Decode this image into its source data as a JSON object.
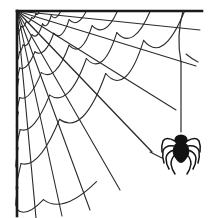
{
  "artwork": {
    "title": "Spider Web Corner With Hanging Spider",
    "type": "line-drawing",
    "width": 212,
    "height": 218,
    "background_color": "#ffffff",
    "line_color": "#2b2b2b",
    "spider_color": "#121212",
    "border_line_color": "#1a1a1a",
    "border_line_width": 2.6,
    "web_line_width": 1.1,
    "silk_line_width": 1.2
  },
  "web": {
    "name": "corner-spider-web",
    "origin": {
      "x": 17,
      "y": 11
    },
    "radial_spoke_count": 8,
    "arc_ring_count": 7,
    "spokes": [
      {
        "id": "spoke-1",
        "angle_deg": 6,
        "end_x": 200,
        "end_y": 30
      },
      {
        "id": "spoke-2",
        "angle_deg": 17,
        "end_x": 196,
        "end_y": 66
      },
      {
        "id": "spoke-3",
        "angle_deg": 30,
        "end_x": 176,
        "end_y": 110
      },
      {
        "id": "spoke-4",
        "angle_deg": 42,
        "end_x": 152,
        "end_y": 152
      },
      {
        "id": "spoke-5",
        "angle_deg": 55,
        "end_x": 120,
        "end_y": 190
      },
      {
        "id": "spoke-6",
        "angle_deg": 66,
        "end_x": 90,
        "end_y": 210
      },
      {
        "id": "spoke-7",
        "angle_deg": 76,
        "end_x": 62,
        "end_y": 216
      },
      {
        "id": "spoke-8",
        "angle_deg": 84,
        "end_x": 36,
        "end_y": 218
      }
    ],
    "arc_radii": [
      22,
      42,
      66,
      96,
      128,
      162,
      200
    ],
    "arc_sag": 0.3
  },
  "borders": {
    "top": {
      "name": "top-border-line",
      "x1": 17,
      "y1": 11,
      "x2": 202,
      "y2": 11
    },
    "left": {
      "name": "left-border-line",
      "x1": 17,
      "y1": 11,
      "x2": 17,
      "y2": 216
    }
  },
  "silk": {
    "name": "spider-silk-thread",
    "anchor_x": 183,
    "anchor_y": 11,
    "attach_x": 181,
    "attach_y": 62,
    "end_x": 181,
    "end_y": 130
  },
  "spider": {
    "name": "hanging-spider",
    "center_x": 181,
    "center_y": 148,
    "head_radius": 6.5,
    "abdomen_radius_x": 8.5,
    "abdomen_radius_y": 10,
    "leg_count": 8,
    "legs_per_side": 4
  }
}
